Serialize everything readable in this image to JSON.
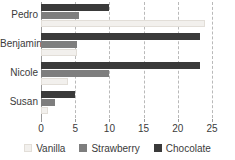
{
  "chart_data": {
    "type": "bar",
    "orientation": "horizontal",
    "title": "",
    "xlabel": "",
    "ylabel": "",
    "categories": [
      "Pedro",
      "Benjamin",
      "Nicole",
      "Susan"
    ],
    "series": [
      {
        "name": "Vanilla",
        "color": "#f2f0ed",
        "values": [
          24,
          5.3,
          4,
          1
        ]
      },
      {
        "name": "Strawberry",
        "color": "#7e7e7e",
        "values": [
          5.5,
          5.3,
          10,
          2
        ]
      },
      {
        "name": "Chocolate",
        "color": "#3a3a3a",
        "values": [
          10,
          23.3,
          23.3,
          5
        ]
      }
    ],
    "xlim": [
      0,
      25
    ],
    "xticks": [
      0,
      5,
      10,
      15,
      20,
      25
    ],
    "xtick_labels": [
      "0",
      "5",
      "10",
      "15",
      "20",
      "25"
    ],
    "grid": true,
    "grid_axis": "x",
    "legend_position": "bottom"
  },
  "legend": {
    "items": [
      {
        "label": "Vanilla"
      },
      {
        "label": "Strawberry"
      },
      {
        "label": "Chocolate"
      }
    ]
  },
  "axis": {
    "ticks": [
      "0",
      "5",
      "10",
      "15",
      "20",
      "25"
    ]
  },
  "categories": [
    {
      "label": "Pedro"
    },
    {
      "label": "Benjamin"
    },
    {
      "label": "Nicole"
    },
    {
      "label": "Susan"
    }
  ]
}
